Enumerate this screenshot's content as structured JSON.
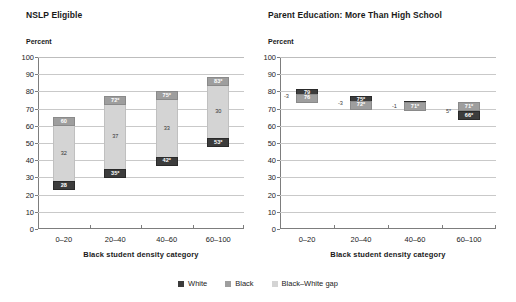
{
  "legend": {
    "items": [
      {
        "label": "White",
        "color": "#3c3c3c",
        "name": "white"
      },
      {
        "label": "Black",
        "color": "#9e9e9e",
        "name": "black"
      },
      {
        "label": "Black–White gap",
        "color": "#d4d4d4",
        "name": "gap"
      }
    ]
  },
  "axis": {
    "y_unit": "Percent",
    "x_title": "Black student density category",
    "y_ticks": [
      "100",
      "90",
      "80",
      "70",
      "60",
      "50",
      "40",
      "30",
      "20",
      "10",
      "0"
    ],
    "x_ticks": [
      "0–20",
      "20–40",
      "40–60",
      "60–100"
    ]
  },
  "panels": [
    {
      "title": "NSLP Eligible",
      "groups": [
        {
          "category": "0–20",
          "white_label": "28",
          "gap_label": "32",
          "black_label": "60",
          "white": 28,
          "black": 60,
          "gap": 32
        },
        {
          "category": "20–40",
          "white_label": "35*",
          "gap_label": "37",
          "black_label": "72*",
          "white": 35,
          "black": 72,
          "gap": 37
        },
        {
          "category": "40–60",
          "white_label": "42*",
          "gap_label": "33",
          "black_label": "75*",
          "white": 42,
          "black": 75,
          "gap": 33
        },
        {
          "category": "60–100",
          "white_label": "53*",
          "gap_label": "30",
          "black_label": "83*",
          "white": 53,
          "black": 83,
          "gap": 30
        }
      ]
    },
    {
      "title": "Parent Education: More Than High School",
      "groups": [
        {
          "category": "0–20",
          "white_label": "79",
          "black_label": "76",
          "gap_label": "-3",
          "white": 79,
          "black": 76,
          "gap": -3
        },
        {
          "category": "20–40",
          "white_label": "75*",
          "black_label": "72*",
          "gap_label": "-3",
          "white": 75,
          "black": 72,
          "gap": -3
        },
        {
          "category": "40–60",
          "white_label": "72*",
          "black_label": "71*",
          "gap_label": "-1",
          "white": 72,
          "black": 71,
          "gap": -1
        },
        {
          "category": "60–100",
          "white_label": "66*",
          "black_label": "71*",
          "gap_label": "5*",
          "white": 66,
          "black": 71,
          "gap": 5
        }
      ]
    }
  ],
  "chart_data": {
    "type": "bar",
    "xlabel": "Black student density category",
    "ylabel": "Percent",
    "ylim": [
      0,
      100
    ],
    "ytick_step": 10,
    "grid": true,
    "legend_position": "bottom-center",
    "categories": [
      "0–20",
      "20–40",
      "40–60",
      "60–100"
    ],
    "panels": [
      {
        "panel_title": "NSLP Eligible",
        "chart_style": "stacked-range-bar",
        "series": [
          {
            "name": "White",
            "values": [
              28,
              35,
              42,
              53
            ],
            "labels": [
              "28",
              "35*",
              "42*",
              "53*"
            ]
          },
          {
            "name": "Black",
            "values": [
              60,
              72,
              75,
              83
            ],
            "labels": [
              "60",
              "72*",
              "75*",
              "83*"
            ]
          },
          {
            "name": "Black–White gap",
            "values": [
              32,
              37,
              33,
              30
            ],
            "labels": [
              "32",
              "37",
              "33",
              "30"
            ]
          }
        ]
      },
      {
        "panel_title": "Parent Education: More Than High School",
        "chart_style": "floating-marker-gap",
        "series": [
          {
            "name": "White",
            "values": [
              79,
              75,
              72,
              66
            ],
            "labels": [
              "79",
              "75*",
              "72*",
              "66*"
            ]
          },
          {
            "name": "Black",
            "values": [
              76,
              72,
              71,
              71
            ],
            "labels": [
              "76",
              "72*",
              "71*",
              "71*"
            ]
          },
          {
            "name": "Black–White gap",
            "values": [
              -3,
              -3,
              -1,
              5
            ],
            "labels": [
              "-3",
              "-3",
              "-1",
              "5*"
            ]
          }
        ]
      }
    ]
  }
}
